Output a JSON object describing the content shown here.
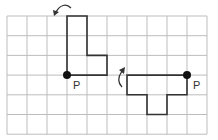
{
  "diagram": {
    "type": "grid-rotation-figure",
    "grid": {
      "columns": 10,
      "rows": 6,
      "line_color": "#bdbdbd"
    },
    "shape_color": "#333333",
    "point_color": "#111111",
    "figures": [
      {
        "name": "original-shape",
        "pivot_label": "P",
        "pivot": [
          3,
          3
        ],
        "outline": [
          [
            3,
            3
          ],
          [
            3,
            0
          ],
          [
            4,
            0
          ],
          [
            4,
            2
          ],
          [
            5,
            2
          ],
          [
            5,
            3
          ]
        ],
        "rotation_arrow": "counterclockwise"
      },
      {
        "name": "rotated-shape",
        "pivot_label": "P",
        "pivot": [
          9,
          3
        ],
        "outline": [
          [
            9,
            3
          ],
          [
            6,
            3
          ],
          [
            6,
            4
          ],
          [
            7,
            4
          ],
          [
            7,
            5
          ],
          [
            8,
            5
          ],
          [
            8,
            4
          ],
          [
            9,
            4
          ]
        ],
        "rotation_arrow": "clockwise"
      }
    ]
  }
}
